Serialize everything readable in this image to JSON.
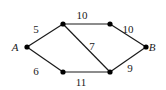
{
  "graph": {
    "nodes": [
      {
        "id": "A",
        "label": "A",
        "x": 27,
        "y": 47,
        "lx": 15,
        "ly": 51,
        "named": true
      },
      {
        "id": "TL",
        "label": "",
        "x": 63,
        "y": 24,
        "named": false
      },
      {
        "id": "TR",
        "label": "",
        "x": 110,
        "y": 24,
        "named": false
      },
      {
        "id": "B",
        "label": "B",
        "x": 146,
        "y": 47,
        "lx": 152,
        "ly": 51,
        "named": true
      },
      {
        "id": "BL",
        "label": "",
        "x": 63,
        "y": 72,
        "named": false
      },
      {
        "id": "BR",
        "label": "",
        "x": 110,
        "y": 72,
        "named": false
      }
    ],
    "edges": [
      {
        "from": "A",
        "to": "TL",
        "weight": "5",
        "lx": 36,
        "ly": 33
      },
      {
        "from": "A",
        "to": "BL",
        "weight": "6",
        "lx": 36,
        "ly": 75
      },
      {
        "from": "TL",
        "to": "TR",
        "weight": "10",
        "lx": 82,
        "ly": 19
      },
      {
        "from": "TL",
        "to": "BR",
        "weight": "7",
        "lx": 92,
        "ly": 50
      },
      {
        "from": "TR",
        "to": "B",
        "weight": "10",
        "lx": 128,
        "ly": 33
      },
      {
        "from": "BL",
        "to": "BR",
        "weight": "11",
        "lx": 81,
        "ly": 86
      },
      {
        "from": "BR",
        "to": "B",
        "weight": "9",
        "lx": 130,
        "ly": 72
      }
    ],
    "style": {
      "line_color": "#1a1a1a",
      "node_color": "#000000"
    }
  }
}
